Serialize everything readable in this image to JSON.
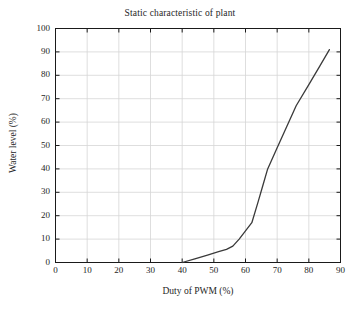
{
  "chart_data": {
    "type": "line",
    "title": "Static characteristic of plant",
    "xlabel": "Duty of PWM (%)",
    "ylabel": "Water level (%)",
    "xlim": [
      0,
      90
    ],
    "ylim": [
      0,
      100
    ],
    "xticks": [
      0,
      10,
      20,
      30,
      40,
      50,
      60,
      70,
      80,
      90
    ],
    "yticks": [
      0,
      10,
      20,
      30,
      40,
      50,
      60,
      70,
      80,
      90,
      100
    ],
    "grid": true,
    "legend": null,
    "series": [
      {
        "name": "Water level vs duty of PWM",
        "color": "#3a3a3a",
        "x": [
          40.0,
          44.0,
          48.0,
          51.5,
          54.0,
          56.0,
          58.0,
          60.0,
          62.0,
          64.0,
          65.5,
          67.0,
          70.0,
          73.0,
          76.0,
          80.0,
          83.5,
          86.5
        ],
        "y": [
          0.0,
          1.6,
          3.2,
          4.6,
          5.6,
          7.0,
          10.0,
          13.5,
          17.0,
          26.0,
          33.0,
          40.0,
          49.0,
          58.0,
          67.0,
          76.0,
          84.0,
          91.0
        ]
      }
    ]
  },
  "figure": {
    "background_color": "#ffffff",
    "axis_color": "#1a1a1a",
    "grid_color": "#d6d6d6",
    "line_color": "#3a3a3a"
  }
}
